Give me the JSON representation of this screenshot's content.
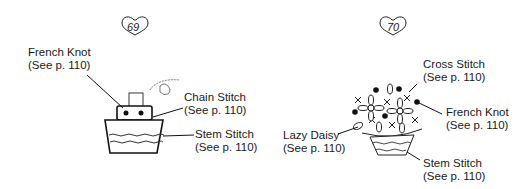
{
  "figures": [
    {
      "number": "69",
      "labels": {
        "french_knot": {
          "name": "French Knot",
          "ref": "(See p. 110)"
        },
        "chain_stitch": {
          "name": "Chain Stitch",
          "ref": "(See p. 110)"
        },
        "stem_stitch": {
          "name": "Stem Stitch",
          "ref": "(See p. 110)"
        }
      }
    },
    {
      "number": "70",
      "labels": {
        "cross_stitch": {
          "name": "Cross Stitch",
          "ref": "(See p. 110)"
        },
        "french_knot": {
          "name": "French Knot",
          "ref": "(See p. 110)"
        },
        "lazy_daisy": {
          "name": "Lazy Daisy",
          "ref": "(See p. 110)"
        },
        "stem_stitch": {
          "name": "Stem Stitch",
          "ref": "(See p. 110)"
        }
      }
    }
  ]
}
